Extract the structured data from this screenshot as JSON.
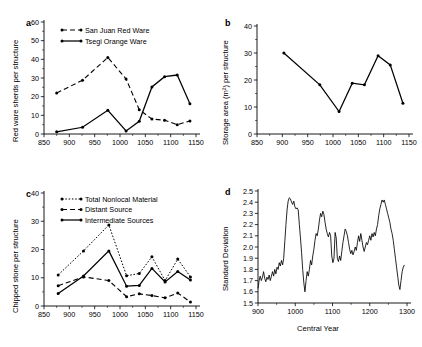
{
  "figure": {
    "panels": [
      "a",
      "b",
      "c",
      "d"
    ]
  },
  "chart_data": [
    {
      "panel": "a",
      "type": "line",
      "title": "",
      "xlabel": "",
      "ylabel": "Red ware sherds per structure",
      "xlim": [
        850,
        1150
      ],
      "ylim": [
        0,
        60
      ],
      "xticks": [
        850,
        900,
        950,
        1000,
        1050,
        1100,
        1150
      ],
      "yticks": [
        0,
        10,
        20,
        30,
        40,
        50,
        60
      ],
      "grid": false,
      "legend_position": "top-left",
      "series": [
        {
          "name": "San Juan Red Ware",
          "style": "dashed",
          "x": [
            875,
            926,
            976,
            1012,
            1038,
            1063,
            1088,
            1113,
            1138
          ],
          "values": [
            22,
            28.8,
            41,
            29.5,
            13,
            8,
            7.4,
            5,
            7
          ]
        },
        {
          "name": "Tsegi Orange Ware",
          "style": "solid",
          "x": [
            875,
            926,
            976,
            1012,
            1038,
            1063,
            1088,
            1113,
            1138
          ],
          "values": [
            1.2,
            3.6,
            12.7,
            1.6,
            6.8,
            25.2,
            30.7,
            31.6,
            16.2
          ]
        }
      ]
    },
    {
      "panel": "b",
      "type": "line",
      "title": "",
      "xlabel": "",
      "ylabel": "Storage area (m²) per structure",
      "xlim": [
        850,
        1150
      ],
      "ylim": [
        0,
        40
      ],
      "xticks": [
        850,
        900,
        950,
        1000,
        1050,
        1100,
        1150
      ],
      "yticks": [
        0,
        10,
        20,
        30,
        40
      ],
      "grid": false,
      "series": [
        {
          "name": "Storage area per structure",
          "style": "solid",
          "x": [
            903,
            974,
            1012,
            1038,
            1062,
            1089,
            1113,
            1138
          ],
          "values": [
            30.0,
            18.2,
            8.3,
            18.8,
            18.2,
            29.0,
            25.6,
            11.4
          ]
        }
      ]
    },
    {
      "panel": "c",
      "type": "line",
      "title": "",
      "xlabel": "",
      "ylabel": "Chipped stone per structure",
      "xlim": [
        850,
        1150
      ],
      "ylim": [
        0,
        40
      ],
      "xticks": [
        850,
        900,
        950,
        1000,
        1050,
        1100,
        1150
      ],
      "yticks": [
        0,
        10,
        20,
        30,
        40
      ],
      "grid": false,
      "legend_position": "top-left",
      "series": [
        {
          "name": "Total Nonlocal Material",
          "style": "dotted",
          "x": [
            878,
            928,
            978,
            1013,
            1038,
            1063,
            1089,
            1114,
            1139
          ],
          "values": [
            11.0,
            19.5,
            28.7,
            10.7,
            11.5,
            17.4,
            9.0,
            16.6,
            10.3
          ]
        },
        {
          "name": "Distant Source",
          "style": "dashed",
          "x": [
            878,
            928,
            978,
            1013,
            1038,
            1063,
            1089,
            1114,
            1139
          ],
          "values": [
            7.2,
            10.3,
            9.0,
            3.3,
            4.3,
            3.7,
            2.9,
            4.6,
            1.4
          ]
        },
        {
          "name": "Intermediate Sources",
          "style": "solid",
          "x": [
            878,
            928,
            978,
            1013,
            1038,
            1063,
            1089,
            1114,
            1139
          ],
          "values": [
            4.4,
            10.6,
            19.5,
            7.0,
            7.3,
            13.3,
            8.5,
            12.2,
            9.2
          ]
        }
      ]
    },
    {
      "panel": "d",
      "type": "line",
      "title": "",
      "xlabel": "Central Year",
      "ylabel": "Standard  Deviation",
      "xlim": [
        900,
        1300
      ],
      "ylim": [
        1.5,
        2.5
      ],
      "xticks": [
        900,
        1000,
        1100,
        1200,
        1300
      ],
      "yticks": [
        1.5,
        1.6,
        1.7,
        1.8,
        1.9,
        2.0,
        2.1,
        2.2,
        2.3,
        2.4,
        2.5
      ],
      "grid": false,
      "series": [
        {
          "name": "Standard Deviation",
          "style": "thin",
          "x": [
            900,
            903,
            906,
            909,
            912,
            915,
            918,
            921,
            924,
            927,
            930,
            933,
            936,
            939,
            942,
            945,
            948,
            951,
            954,
            957,
            960,
            963,
            966,
            969,
            972,
            975,
            978,
            981,
            984,
            987,
            990,
            993,
            996,
            999,
            1002,
            1005,
            1008,
            1011,
            1014,
            1017,
            1020,
            1023,
            1026,
            1029,
            1032,
            1035,
            1038,
            1041,
            1044,
            1047,
            1050,
            1053,
            1056,
            1059,
            1062,
            1065,
            1068,
            1071,
            1074,
            1077,
            1080,
            1083,
            1086,
            1089,
            1092,
            1095,
            1098,
            1101,
            1104,
            1107,
            1110,
            1113,
            1116,
            1119,
            1122,
            1125,
            1128,
            1131,
            1134,
            1137,
            1140,
            1143,
            1146,
            1149,
            1152,
            1155,
            1158,
            1161,
            1164,
            1167,
            1170,
            1173,
            1176,
            1179,
            1182,
            1185,
            1188,
            1191,
            1194,
            1197,
            1200,
            1203,
            1206,
            1209,
            1212,
            1215,
            1218,
            1221,
            1224,
            1227,
            1230,
            1233,
            1236,
            1239,
            1242,
            1245,
            1248,
            1251,
            1254,
            1257,
            1260,
            1263,
            1266,
            1269,
            1272,
            1275,
            1278,
            1281,
            1284,
            1287,
            1290,
            1293,
            1296,
            1299
          ],
          "values": [
            1.63,
            1.7,
            1.74,
            1.7,
            1.73,
            1.78,
            1.72,
            1.69,
            1.73,
            1.71,
            1.75,
            1.7,
            1.74,
            1.78,
            1.74,
            1.8,
            1.76,
            1.82,
            1.8,
            1.86,
            1.83,
            1.88,
            1.84,
            1.9,
            2.05,
            2.2,
            2.33,
            2.41,
            2.44,
            2.43,
            2.4,
            2.38,
            2.41,
            2.36,
            2.34,
            2.35,
            2.33,
            2.2,
            2.08,
            1.95,
            1.8,
            1.68,
            1.6,
            1.7,
            1.78,
            1.74,
            1.8,
            1.88,
            1.84,
            1.92,
            1.98,
            2.06,
            2.12,
            2.1,
            2.16,
            2.24,
            2.3,
            2.27,
            2.32,
            2.29,
            2.22,
            2.16,
            2.12,
            2.09,
            2.13,
            2.1,
            1.92,
            1.86,
            1.9,
            2.13,
            2.08,
            1.9,
            1.87,
            1.92,
            1.88,
            1.96,
            2.04,
            2.1,
            2.16,
            2.14,
            2.1,
            2.04,
            1.98,
            1.94,
            1.97,
            1.93,
            1.96,
            2.0,
            1.97,
            2.04,
            2.1,
            2.05,
            2.12,
            2.06,
            2.0,
            1.96,
            2.0,
            2.04,
            2.02,
            2.06,
            2.1,
            2.06,
            2.12,
            2.09,
            2.13,
            2.1,
            2.16,
            2.2,
            2.28,
            2.34,
            2.38,
            2.42,
            2.4,
            2.42,
            2.38,
            2.34,
            2.3,
            2.26,
            2.22,
            2.16,
            2.12,
            2.06,
            1.98,
            1.9,
            1.82,
            1.74,
            1.66,
            1.62,
            1.7,
            1.78,
            1.82,
            1.84
          ]
        }
      ]
    }
  ]
}
